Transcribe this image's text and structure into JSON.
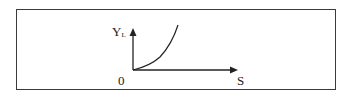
{
  "diagram": {
    "y_axis_label": "Y",
    "y_axis_subscript": "L",
    "x_axis_label": "S",
    "origin_label": "0",
    "curve": "increasing convex curve from origin"
  },
  "colors": {
    "stroke": "#222222",
    "border": "#3a3a3a",
    "background": "#ffffff"
  }
}
